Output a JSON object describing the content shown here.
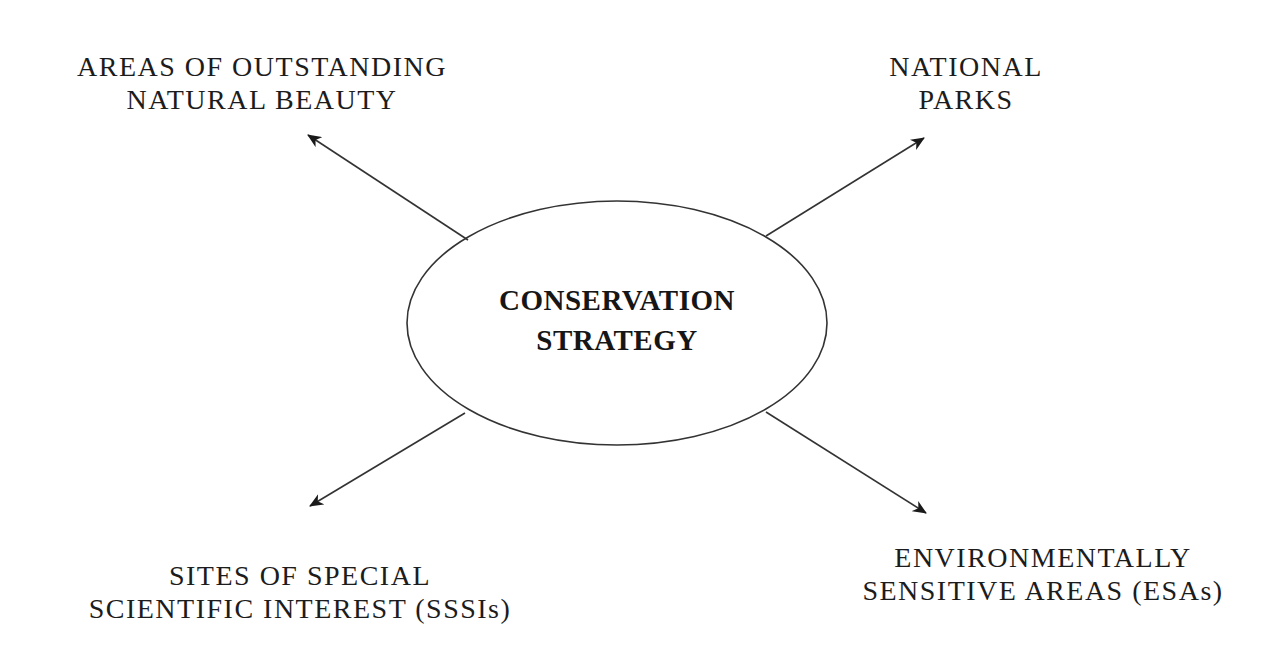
{
  "diagram": {
    "type": "hub-and-spoke",
    "center": {
      "lines": [
        "CONSERVATION",
        "STRATEGY"
      ]
    },
    "nodes": [
      {
        "id": "aonb",
        "position": "top-left",
        "lines": [
          "AREAS OF OUTSTANDING",
          "NATURAL BEAUTY"
        ]
      },
      {
        "id": "national-parks",
        "position": "top-right",
        "lines": [
          "NATIONAL",
          "PARKS"
        ]
      },
      {
        "id": "sssi",
        "position": "bottom-left",
        "lines": [
          "SITES OF SPECIAL",
          "SCIENTIFIC INTEREST (SSSIs)"
        ]
      },
      {
        "id": "esa",
        "position": "bottom-right",
        "lines": [
          "ENVIRONMENTALLY",
          "SENSITIVE AREAS (ESAs)"
        ]
      }
    ],
    "edges": [
      {
        "from": "center",
        "to": "aonb"
      },
      {
        "from": "center",
        "to": "national-parks"
      },
      {
        "from": "center",
        "to": "sssi"
      },
      {
        "from": "center",
        "to": "esa"
      }
    ],
    "colors": {
      "background": "#ffffff",
      "stroke": "#333333",
      "text": "#1c1c1c"
    }
  }
}
